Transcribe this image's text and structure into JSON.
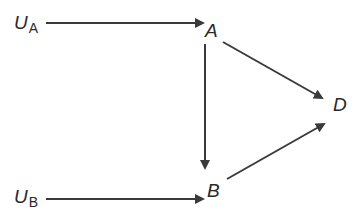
{
  "diagram": {
    "type": "causal-dag",
    "nodes": [
      {
        "id": "UA",
        "label": "U",
        "subscript": "A",
        "x": 14,
        "y": 29
      },
      {
        "id": "A",
        "label": "A",
        "x": 205,
        "y": 37
      },
      {
        "id": "D",
        "label": "D",
        "x": 333,
        "y": 111
      },
      {
        "id": "B",
        "label": "B",
        "x": 207,
        "y": 197
      },
      {
        "id": "UB",
        "label": "U",
        "subscript": "B",
        "x": 14,
        "y": 203
      }
    ],
    "edges": [
      {
        "from": "UA",
        "to": "A"
      },
      {
        "from": "A",
        "to": "D"
      },
      {
        "from": "A",
        "to": "B"
      },
      {
        "from": "B",
        "to": "D"
      },
      {
        "from": "UB",
        "to": "B"
      }
    ],
    "colors": {
      "ink": "#2a2a2a",
      "edge": "#3a3a3a",
      "background": "#ffffff"
    }
  }
}
